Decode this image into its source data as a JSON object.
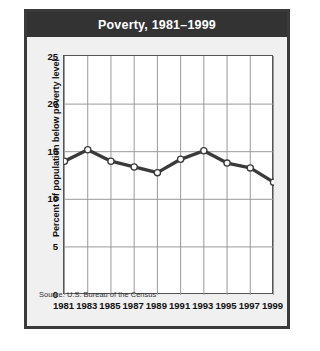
{
  "figure": {
    "title": "Poverty, 1981–1999",
    "source": "Source: U.S. Bureau of the Census"
  },
  "chart_data": {
    "type": "line",
    "title": "Poverty, 1981–1999",
    "xlabel": "",
    "ylabel": "Percent of population below poverty level",
    "categories": [
      "1981",
      "1983",
      "1985",
      "1987",
      "1989",
      "1991",
      "1993",
      "1995",
      "1997",
      "1999"
    ],
    "values": [
      14.0,
      15.2,
      14.0,
      13.4,
      12.8,
      14.2,
      15.1,
      13.8,
      13.3,
      11.8
    ],
    "x": [
      1981,
      1983,
      1985,
      1987,
      1989,
      1991,
      1993,
      1995,
      1997,
      1999
    ],
    "xtick_labels": [
      "1981",
      "1983",
      "1985",
      "1987",
      "1989",
      "1991",
      "1993",
      "1995",
      "1997",
      "1999"
    ],
    "ytick_labels": [
      "0",
      "5",
      "10",
      "15",
      "20",
      "25"
    ],
    "yticks": [
      0,
      5,
      10,
      15,
      20,
      25
    ],
    "ylim": [
      0,
      25
    ],
    "xlim": [
      1981,
      1999
    ],
    "grid": true,
    "legend": false,
    "marker": "circle-open",
    "line_color": "#3a3a3a",
    "marker_face_color": "#ffffff",
    "grid_color": "#999999",
    "plot_background": "#ffffff",
    "title_background": "#333333",
    "title_color": "#ffffff"
  }
}
